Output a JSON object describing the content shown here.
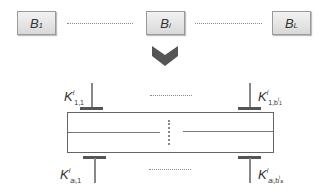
{
  "blocks": [
    {
      "base": "B",
      "sub": "1"
    },
    {
      "base": "B",
      "sub": "i"
    },
    {
      "base": "B",
      "sub": "L"
    }
  ],
  "arrow": {
    "icon": "chevron-down-icon",
    "color": "#555555"
  },
  "keys": {
    "top_left": {
      "base": "K",
      "sup": "i",
      "sub": "1,1"
    },
    "top_right": {
      "base": "K",
      "sup": "i",
      "sub": "1,b",
      "sub_sup": "i",
      "sub_sub": "1"
    },
    "bottom_left": {
      "base": "K",
      "sup": "i",
      "sub": "a",
      "sub_sub": "i",
      "sub_tail": ",1"
    },
    "bottom_right": {
      "base": "K",
      "sup": "i",
      "sub": "a",
      "sub_sub": "i",
      "sub_tail": ",b",
      "tail_sup": "i",
      "tail_sub": "a"
    }
  },
  "colors": {
    "block_border": "#9a9a9a",
    "block_fill_top": "#f2f2f2",
    "block_fill_bottom": "#d9d9d9",
    "pin_bar": "#555555",
    "pin_stem": "#888888",
    "outline": "#666666",
    "dots": "#8a8a8a"
  }
}
